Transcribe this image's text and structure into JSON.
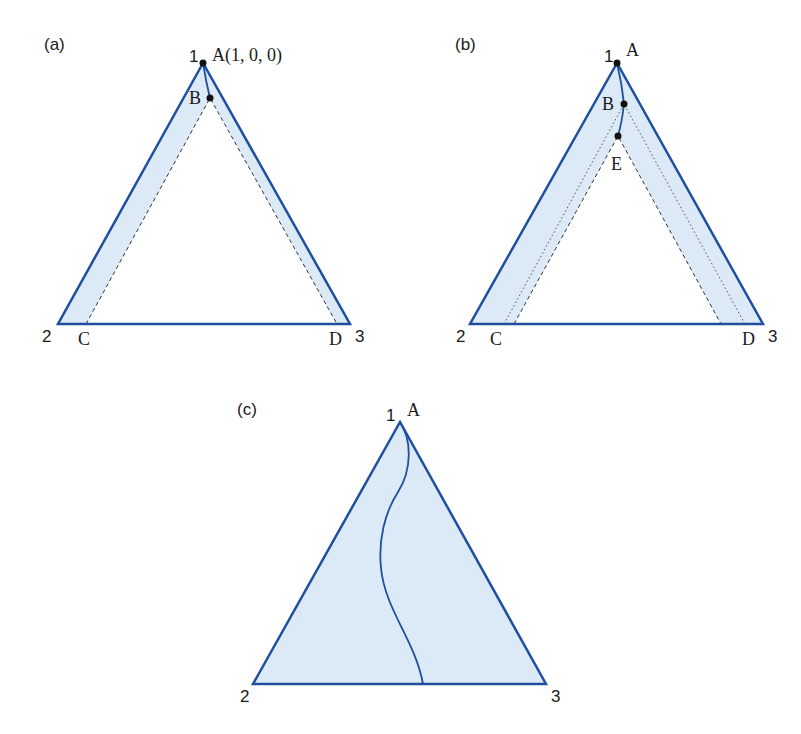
{
  "colors": {
    "edge": "#1f4f9e",
    "fill": "#dce9f6",
    "text": "#1a1a1a",
    "guide": "#333333"
  },
  "panels": [
    {
      "id": "a",
      "label": "(a)",
      "vertex_labels": {
        "v1": "1",
        "v2": "2",
        "v3": "3"
      },
      "points": {
        "A": "A(1, 0, 0)",
        "B": "B",
        "C": "C",
        "D": "D"
      }
    },
    {
      "id": "b",
      "label": "(b)",
      "vertex_labels": {
        "v1": "1",
        "v2": "2",
        "v3": "3"
      },
      "points": {
        "A": "A",
        "B": "B",
        "E": "E",
        "C": "C",
        "D": "D"
      }
    },
    {
      "id": "c",
      "label": "(c)",
      "vertex_labels": {
        "v1": "1",
        "v2": "2",
        "v3": "3"
      },
      "points": {
        "A": "A"
      }
    }
  ]
}
